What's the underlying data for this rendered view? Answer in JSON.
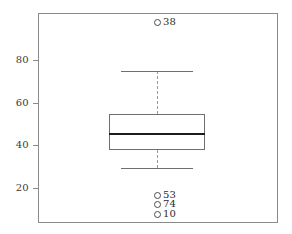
{
  "chart_data": {
    "type": "box",
    "title": "",
    "xlabel": "",
    "ylabel": "",
    "ylim": [
      6,
      99
    ],
    "grid": false,
    "legend": null,
    "y_ticks": [
      {
        "label": "20",
        "value": 20
      },
      {
        "label": "40",
        "value": 40
      },
      {
        "label": "60",
        "value": 60
      },
      {
        "label": "80",
        "value": 80
      }
    ],
    "categories": [
      ""
    ],
    "boxes": [
      {
        "name": "",
        "min_whisker": 29.5,
        "q1": 38,
        "median": 45.5,
        "q3": 54.5,
        "max_whisker": 75,
        "outliers": [
          {
            "label": "38",
            "value": 98
          },
          {
            "label": "53",
            "value": 16.5
          },
          {
            "label": "74",
            "value": 12.5
          },
          {
            "label": "10",
            "value": 8.0
          }
        ]
      }
    ]
  },
  "style": {
    "frame_color": "#8a8a8a",
    "box_color": "#6f6f6f",
    "median_color": "#1c1c1c",
    "whisker_color": "#9a9a9a",
    "outlier_color": "#4a4a4a",
    "background": "#ffffff"
  }
}
